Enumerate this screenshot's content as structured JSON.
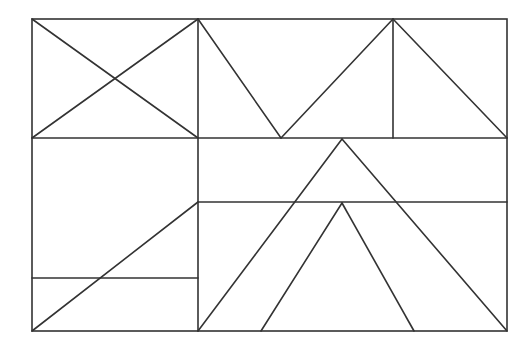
{
  "figure": {
    "width": 530,
    "height": 346,
    "background": "#ffffff",
    "stroke_color": "#333333",
    "stroke_width": 1.6
  },
  "outer_rect": {
    "x1": 32,
    "y1": 19,
    "x2": 507,
    "y2": 331
  },
  "segments": [
    {
      "name": "top-left-diagonal-down",
      "x1": 32,
      "y1": 19,
      "x2": 198,
      "y2": 138
    },
    {
      "name": "top-left-diagonal-up",
      "x1": 32,
      "y1": 138,
      "x2": 198,
      "y2": 19
    },
    {
      "name": "vertical-divider-left",
      "x1": 198,
      "y1": 19,
      "x2": 198,
      "y2": 331
    },
    {
      "name": "horizontal-divider-top",
      "x1": 32,
      "y1": 138,
      "x2": 507,
      "y2": 138
    },
    {
      "name": "v-left-arm",
      "x1": 198,
      "y1": 19,
      "x2": 281,
      "y2": 138
    },
    {
      "name": "v-right-arm",
      "x1": 281,
      "y1": 138,
      "x2": 393,
      "y2": 19
    },
    {
      "name": "vertical-divider-top-right",
      "x1": 393,
      "y1": 19,
      "x2": 393,
      "y2": 138
    },
    {
      "name": "top-right-diagonal",
      "x1": 393,
      "y1": 19,
      "x2": 507,
      "y2": 138
    },
    {
      "name": "horizontal-divider-middle-right",
      "x1": 198,
      "y1": 202,
      "x2": 507,
      "y2": 202
    },
    {
      "name": "horizontal-divider-lower-left",
      "x1": 32,
      "y1": 278,
      "x2": 198,
      "y2": 278
    },
    {
      "name": "lower-left-diagonal",
      "x1": 32,
      "y1": 331,
      "x2": 198,
      "y2": 202
    },
    {
      "name": "big-triangle-left",
      "x1": 342,
      "y1": 139,
      "x2": 198,
      "y2": 331
    },
    {
      "name": "big-triangle-right",
      "x1": 342,
      "y1": 139,
      "x2": 507,
      "y2": 331
    },
    {
      "name": "inner-triangle-left",
      "x1": 342,
      "y1": 203,
      "x2": 261,
      "y2": 331
    },
    {
      "name": "inner-triangle-right",
      "x1": 342,
      "y1": 203,
      "x2": 414,
      "y2": 331
    }
  ]
}
